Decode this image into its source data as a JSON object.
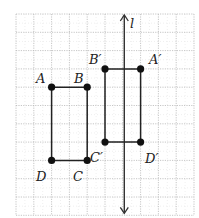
{
  "diagram": {
    "type": "reflection-on-grid",
    "grid": {
      "columns": 10,
      "rows": 11,
      "origin_px": [
        16,
        14
      ],
      "cell_w": 17.8,
      "cell_h": 18.3,
      "line_color": "#b8b8b8"
    },
    "line_of_reflection": {
      "label": "l",
      "column": 6,
      "color": "#333333"
    },
    "figures": [
      {
        "name": "ABCD",
        "vertices": [
          {
            "label": "A",
            "col": 2,
            "row": 4
          },
          {
            "label": "B",
            "col": 4,
            "row": 4
          },
          {
            "label": "C",
            "col": 4,
            "row": 8
          },
          {
            "label": "D",
            "col": 2,
            "row": 8
          }
        ]
      },
      {
        "name": "A'B'C'D'",
        "vertices": [
          {
            "label": "A′",
            "col": 7,
            "row": 3
          },
          {
            "label": "B′",
            "col": 5,
            "row": 3
          },
          {
            "label": "C′",
            "col": 5,
            "row": 7
          },
          {
            "label": "D′",
            "col": 7,
            "row": 7
          }
        ]
      }
    ],
    "labels": {
      "A": "A",
      "B": "B",
      "C": "C",
      "D": "D",
      "A_prime": "A′",
      "B_prime": "B′",
      "C_prime": "C′",
      "D_prime": "D′",
      "l": "l"
    },
    "stroke_color": "#222222"
  }
}
